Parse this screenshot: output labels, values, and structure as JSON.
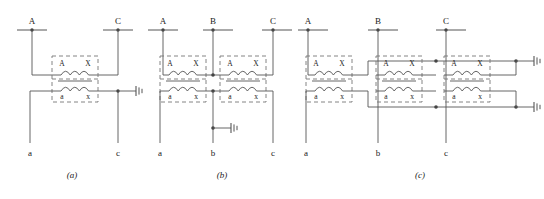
{
  "figure": {
    "background_color": "#ffffff",
    "line_color": "#555555",
    "text_color": "#1a1a1a",
    "winding_label_primary_start": "A",
    "winding_label_primary_end": "X",
    "winding_label_secondary_start": "a",
    "winding_label_secondary_end": "x"
  },
  "panels": [
    {
      "caption": "(a)",
      "top_terminals": [
        "A",
        "C"
      ],
      "bottom_terminals": [
        "a",
        "c"
      ],
      "transformer_count": 1,
      "ground_count": 1,
      "transformers": [
        {
          "primary": {
            "start": "A",
            "end": "X"
          },
          "secondary": {
            "start": "a",
            "end": "x"
          }
        }
      ]
    },
    {
      "caption": "(b)",
      "top_terminals": [
        "A",
        "B",
        "C"
      ],
      "bottom_terminals": [
        "a",
        "b",
        "c"
      ],
      "transformer_count": 2,
      "ground_count": 1,
      "transformers": [
        {
          "primary": {
            "start": "A",
            "end": "X"
          },
          "secondary": {
            "start": "a",
            "end": "x"
          }
        },
        {
          "primary": {
            "start": "A",
            "end": "X"
          },
          "secondary": {
            "start": "a",
            "end": "x"
          }
        }
      ]
    },
    {
      "caption": "(c)",
      "top_terminals": [
        "A",
        "B",
        "C"
      ],
      "bottom_terminals": [
        "a",
        "b",
        "c"
      ],
      "transformer_count": 3,
      "ground_count": 2,
      "transformers": [
        {
          "primary": {
            "start": "A",
            "end": "X"
          },
          "secondary": {
            "start": "a",
            "end": "x"
          }
        },
        {
          "primary": {
            "start": "A",
            "end": "X"
          },
          "secondary": {
            "start": "a",
            "end": "x"
          }
        },
        {
          "primary": {
            "start": "A",
            "end": "X"
          },
          "secondary": {
            "start": "a",
            "end": "x"
          }
        }
      ]
    }
  ]
}
